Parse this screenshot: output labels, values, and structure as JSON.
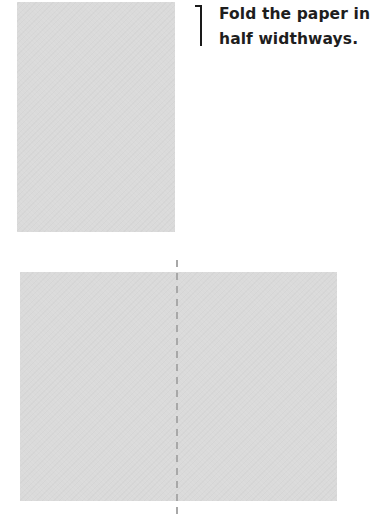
{
  "instruction": {
    "step_text_line1": "Fold the paper in",
    "step_text_line2": "half widthways."
  },
  "illustration": {
    "paper_color": "#dadada",
    "fold_line_color": "#a8a8a8",
    "fold_line_style": "dashed",
    "panels": [
      {
        "name": "unfolded-paper-portrait"
      },
      {
        "name": "paper-landscape-with-fold-line"
      }
    ]
  }
}
